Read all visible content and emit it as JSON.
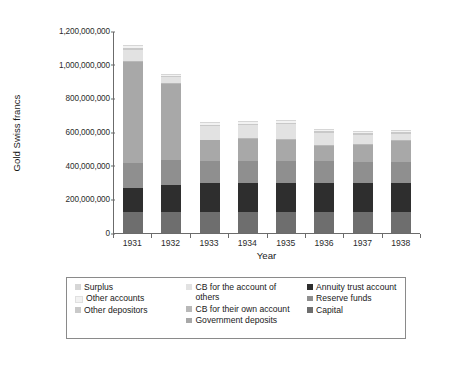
{
  "chart_data": {
    "type": "bar",
    "subtype": "stacked-column",
    "title": "",
    "xlabel": "Year",
    "ylabel": "Gold Swiss francs",
    "categories": [
      "1931",
      "1932",
      "1933",
      "1934",
      "1935",
      "1936",
      "1937",
      "1938"
    ],
    "ylim": [
      0,
      1200000000
    ],
    "yticks": [
      0,
      200000000,
      400000000,
      600000000,
      800000000,
      1000000000,
      1200000000
    ],
    "ytick_labels": [
      "0",
      "200,000,000",
      "400,000,000",
      "600,000,000",
      "800,000,000",
      "1,000,000,000",
      "1,200,000,000"
    ],
    "grid": false,
    "legend_position": "bottom",
    "stack_order_bottom_to_top": [
      "Capital",
      "Annuity trust account",
      "Reserve funds",
      "Government deposits",
      "CB for their own account",
      "CB for the account of others",
      "Other depositors",
      "Other accounts",
      "Surplus"
    ],
    "series": [
      {
        "name": "Capital",
        "color": "#6e6e6e",
        "values": [
          125000000,
          125000000,
          125000000,
          125000000,
          125000000,
          125000000,
          125000000,
          125000000
        ]
      },
      {
        "name": "Annuity trust account",
        "color": "#2e2e2e",
        "values": [
          145000000,
          160000000,
          175000000,
          175000000,
          175000000,
          175000000,
          175000000,
          175000000
        ]
      },
      {
        "name": "Reserve funds",
        "color": "#8f8f8f",
        "values": [
          145000000,
          150000000,
          130000000,
          130000000,
          130000000,
          125000000,
          120000000,
          120000000
        ]
      },
      {
        "name": "Government deposits",
        "color": "#a8a8a8",
        "values": [
          600000000,
          450000000,
          120000000,
          130000000,
          125000000,
          95000000,
          105000000,
          125000000
        ]
      },
      {
        "name": "CB for their own account",
        "color": "#b8b8b8",
        "values": [
          5000000,
          5000000,
          5000000,
          5000000,
          5000000,
          5000000,
          5000000,
          5000000
        ]
      },
      {
        "name": "CB for the account of others",
        "color": "#e2e2e2",
        "values": [
          70000000,
          35000000,
          80000000,
          75000000,
          85000000,
          70000000,
          55000000,
          40000000
        ]
      },
      {
        "name": "Other depositors",
        "color": "#c9c9c9",
        "values": [
          12000000,
          8000000,
          10000000,
          10000000,
          10000000,
          10000000,
          10000000,
          10000000
        ]
      },
      {
        "name": "Other accounts",
        "color": "#f2f2f2",
        "values": [
          10000000,
          8000000,
          8000000,
          8000000,
          8000000,
          8000000,
          8000000,
          8000000
        ]
      },
      {
        "name": "Surplus",
        "color": "#d6d6d6",
        "values": [
          8000000,
          6000000,
          6000000,
          6000000,
          6000000,
          6000000,
          6000000,
          6000000
        ]
      }
    ],
    "totals": [
      1120000000,
      947000000,
      659000000,
      664000000,
      664000000,
      619000000,
      604000000,
      608000000
    ]
  },
  "legend": {
    "columns": [
      {
        "items": [
          {
            "label": "Surplus",
            "color": "#d6d6d6"
          },
          {
            "label": "Other accounts",
            "color": "#f2f2f2"
          },
          {
            "label": "Other depositors",
            "color": "#c9c9c9"
          }
        ]
      },
      {
        "items": [
          {
            "label": "CB for the account of others",
            "color": "#e2e2e2"
          },
          {
            "label": "CB for their own account",
            "color": "#b8b8b8"
          },
          {
            "label": "Government deposits",
            "color": "#a8a8a8"
          }
        ]
      },
      {
        "items": [
          {
            "label": "Annuity trust account",
            "color": "#2e2e2e"
          },
          {
            "label": "Reserve funds",
            "color": "#8f8f8f"
          },
          {
            "label": "Capital",
            "color": "#6e6e6e"
          }
        ]
      }
    ]
  },
  "axes": {
    "y_title": "Gold Swiss francs",
    "x_title": "Year"
  }
}
